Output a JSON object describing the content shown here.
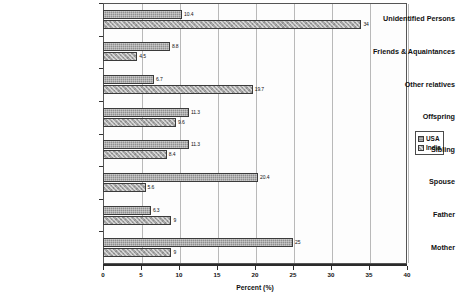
{
  "chart_data": {
    "type": "bar",
    "orientation": "horizontal",
    "title": "",
    "xlabel": "Percent (%)",
    "ylabel": "",
    "xlim": [
      0,
      40
    ],
    "xticks": [
      0,
      5,
      10,
      15,
      20,
      25,
      30,
      35,
      40
    ],
    "grid": true,
    "legend_position": "right",
    "categories": [
      "Unidentified Persons",
      "Friends & Aquaintances",
      "Other relatives",
      "Offspring",
      "Sibling",
      "Spouse",
      "Father",
      "Mother"
    ],
    "series": [
      {
        "name": "USA",
        "values": [
          10.4,
          8.8,
          6.7,
          11.3,
          11.3,
          20.4,
          6.3,
          25
        ],
        "labels": [
          "10.4",
          "8.8",
          "6.7",
          "11.3",
          "11.3",
          "20.4",
          "6.3",
          "25"
        ]
      },
      {
        "name": "India",
        "values": [
          34,
          4.5,
          19.7,
          9.6,
          8.4,
          5.6,
          9,
          9
        ],
        "labels": [
          "34",
          "4.5",
          "19.7",
          "9.6",
          "8.4",
          "5.6",
          "9",
          "9"
        ]
      }
    ]
  },
  "legend": {
    "items": [
      {
        "label": "USA"
      },
      {
        "label": "India"
      }
    ]
  },
  "axis": {
    "x_title": "Percent (%)"
  }
}
